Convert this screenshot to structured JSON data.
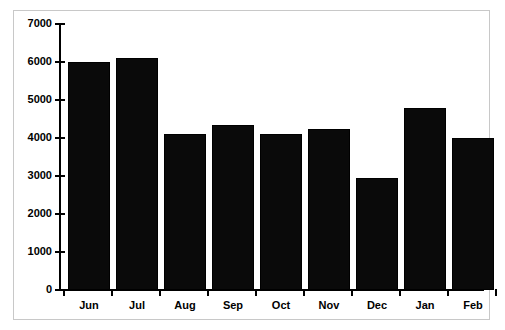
{
  "chart_data": {
    "type": "bar",
    "title": "",
    "subtitle": "",
    "xlabel": "",
    "ylabel": "",
    "categories": [
      "Jun",
      "Jul",
      "Aug",
      "Sep",
      "Oct",
      "Nov",
      "Dec",
      "Jan",
      "Feb"
    ],
    "values": [
      6000,
      6100,
      4100,
      4330,
      4100,
      4240,
      2950,
      4790,
      4000
    ],
    "ylim": [
      0,
      7000
    ],
    "ytick_labels": [
      "7000",
      "6000",
      "5000",
      "4000",
      "3000",
      "2000",
      "1000",
      "0"
    ],
    "ytick_values": [
      7000,
      6000,
      5000,
      4000,
      3000,
      2000,
      1000,
      0
    ],
    "grid": false,
    "legend": false,
    "legend_position": "none",
    "bar_color": "#000000",
    "axis_color": "#000000",
    "frame_color": "#c8c8c8",
    "background": "#ffffff"
  }
}
